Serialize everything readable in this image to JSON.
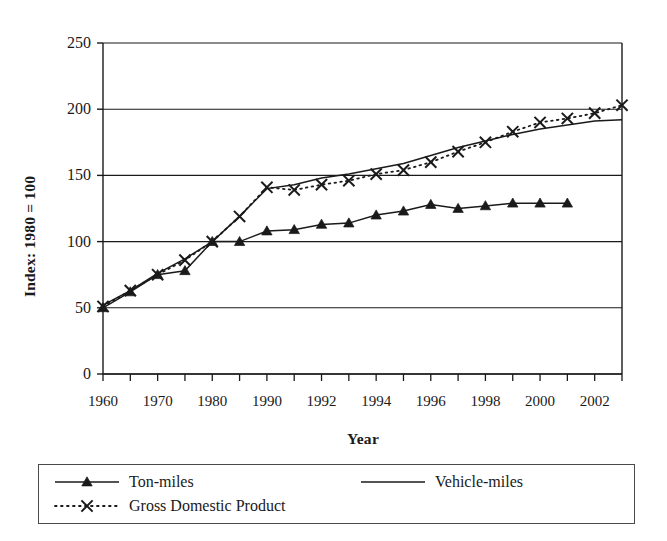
{
  "figure": {
    "clipped_caption": "",
    "background_color": "#ffffff",
    "ink_color": "#1a1a1a"
  },
  "axis": {
    "y_title": "Index: 1980 = 100",
    "x_title": "Year",
    "y_ticks": [
      "0",
      "50",
      "100",
      "150",
      "200",
      "250"
    ],
    "x_ticks": [
      "1960",
      "1970",
      "1980",
      "1990",
      "1992",
      "1994",
      "1996",
      "1998",
      "2000",
      "2002"
    ]
  },
  "legend": {
    "entries": [
      {
        "label": "Ton-miles",
        "style": "solid-triangle",
        "marker": "triangle-up-marker"
      },
      {
        "label": "Vehicle-miles",
        "style": "solid-plain",
        "marker": "none"
      },
      {
        "label": "Gross Domestic Product",
        "style": "dotted-cross",
        "marker": "x-cross-marker"
      }
    ]
  },
  "chart_data": {
    "type": "line",
    "title": "",
    "xlabel": "Year",
    "ylabel": "Index: 1980 = 100",
    "ylim": [
      0,
      250
    ],
    "ytick_values": [
      0,
      50,
      100,
      150,
      200,
      250
    ],
    "grid": "horizontal",
    "legend_position": "below-plot",
    "x_axis_type": "category",
    "categories": [
      "1960",
      "1965",
      "1970",
      "1975",
      "1980",
      "1985",
      "1990",
      "1991",
      "1992",
      "1993",
      "1994",
      "1995",
      "1996",
      "1997",
      "1998",
      "1999",
      "2000",
      "2001",
      "2002",
      "2003"
    ],
    "labeled_categories": [
      "1960",
      "1970",
      "1980",
      "1990",
      "1992",
      "1994",
      "1996",
      "1998",
      "2000",
      "2002"
    ],
    "series": [
      {
        "name": "Ton-miles",
        "marker": "triangle",
        "line": "solid",
        "values": [
          50,
          62,
          75,
          78,
          100,
          100,
          108,
          109,
          113,
          114,
          120,
          123,
          128,
          125,
          127,
          129,
          129,
          129,
          null,
          null
        ]
      },
      {
        "name": "Vehicle-miles",
        "marker": "none",
        "line": "solid",
        "values": [
          52,
          63,
          76,
          87,
          100,
          119,
          140,
          143,
          148,
          151,
          155,
          159,
          165,
          171,
          176,
          181,
          185,
          188,
          191,
          192
        ]
      },
      {
        "name": "Gross Domestic Product",
        "marker": "x",
        "line": "dotted",
        "values": [
          51,
          63,
          75,
          86,
          100,
          119,
          141,
          139,
          143,
          146,
          151,
          154,
          160,
          168,
          175,
          183,
          190,
          193,
          197,
          203
        ]
      }
    ]
  }
}
